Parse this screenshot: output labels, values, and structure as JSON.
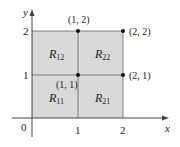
{
  "figure": {
    "axes": {
      "x_label": "x",
      "y_label": "y",
      "origin_label": "0",
      "x_ticks": [
        "1",
        "2"
      ],
      "y_ticks": [
        "1",
        "2"
      ]
    },
    "regions": [
      {
        "name": "R",
        "sub": "11"
      },
      {
        "name": "R",
        "sub": "12"
      },
      {
        "name": "R",
        "sub": "21"
      },
      {
        "name": "R",
        "sub": "22"
      }
    ],
    "points": [
      {
        "label": "(1, 1)"
      },
      {
        "label": "(1, 2)"
      },
      {
        "label": "(2, 1)"
      },
      {
        "label": "(2, 2)"
      }
    ],
    "colors": {
      "fill": "#d9d9d9",
      "lines": "#555555",
      "axis": "#444444"
    }
  }
}
